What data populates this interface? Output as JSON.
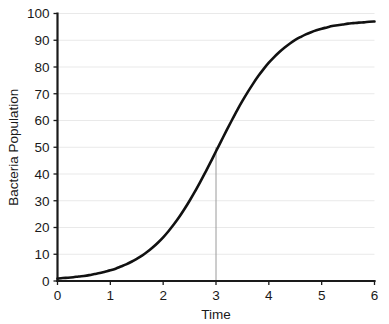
{
  "chart_data": {
    "type": "line",
    "title": "",
    "subtitle": "",
    "xlabel": "Time",
    "ylabel": "Bacteria Population",
    "xlim": [
      0,
      6
    ],
    "ylim": [
      0,
      100
    ],
    "xticks": [
      "0",
      "1",
      "2",
      "3",
      "4",
      "5",
      "6"
    ],
    "yticks": [
      "0",
      "10",
      "20",
      "30",
      "40",
      "50",
      "60",
      "70",
      "80",
      "90",
      "100"
    ],
    "grid": "horizontal",
    "legend": "none",
    "series": [
      {
        "name": "Bacteria Population",
        "color": "#111111",
        "x": [
          0.0,
          0.1,
          0.2,
          0.3,
          0.4,
          0.5,
          0.6,
          0.7,
          0.8,
          0.9,
          1.0,
          1.1,
          1.2,
          1.3,
          1.4,
          1.5,
          1.6,
          1.7,
          1.8,
          1.9,
          2.0,
          2.1,
          2.2,
          2.3,
          2.4,
          2.5,
          2.6,
          2.7,
          2.8,
          2.9,
          3.0,
          3.1,
          3.2,
          3.3,
          3.4,
          3.5,
          3.6,
          3.7,
          3.8,
          3.9,
          4.0,
          4.1,
          4.2,
          4.3,
          4.4,
          4.5,
          4.6,
          4.7,
          4.8,
          4.9,
          5.0,
          5.1,
          5.2,
          5.3,
          5.4,
          5.5,
          5.6,
          5.7,
          5.8,
          5.9,
          6.0
        ],
        "values": [
          0.9,
          1.1,
          1.2,
          1.4,
          1.7,
          1.9,
          2.2,
          2.6,
          3.0,
          3.5,
          4.0,
          4.6,
          5.4,
          6.2,
          7.2,
          8.3,
          9.5,
          10.9,
          12.5,
          14.3,
          16.3,
          18.6,
          21.1,
          23.8,
          26.8,
          30.0,
          33.4,
          37.0,
          40.7,
          44.5,
          48.5,
          52.4,
          56.3,
          60.1,
          63.8,
          67.3,
          70.6,
          73.7,
          76.6,
          79.2,
          81.6,
          83.7,
          85.6,
          87.3,
          88.8,
          90.1,
          91.2,
          92.2,
          93.0,
          93.7,
          94.3,
          94.8,
          95.3,
          95.6,
          95.9,
          96.2,
          96.4,
          96.6,
          96.7,
          96.9,
          97.0
        ]
      }
    ],
    "annotations": [
      {
        "name": "midpoint-reference-line",
        "type": "vertical-line",
        "x": 3,
        "y_from": 0,
        "y_to": 50,
        "color": "#9a9a9a"
      }
    ],
    "colors": {
      "curve": "#111111",
      "axis": "#1a1a1a",
      "gridline": "#e9e9e9",
      "reference_line": "#9a9a9a",
      "background": "#ffffff",
      "text": "#1a1a1a"
    }
  }
}
